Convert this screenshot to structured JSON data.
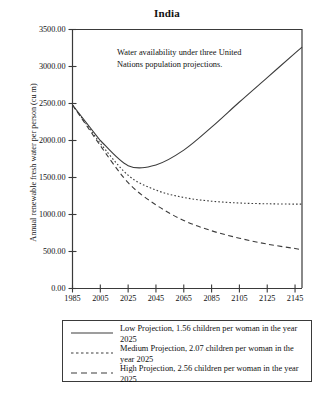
{
  "chart_data": {
    "type": "line",
    "title": "India",
    "xlabel": "",
    "ylabel": "Annual renewable fresh water per person (cu m)",
    "xlim": [
      1985,
      2150
    ],
    "ylim": [
      0,
      3500
    ],
    "grid": false,
    "legend_position": "below",
    "annotation": "Water availability under three United Nations population projections.",
    "xticks": [
      "1985",
      "2005",
      "2025",
      "2045",
      "2065",
      "2085",
      "2105",
      "2125",
      "2145"
    ],
    "xtick_values": [
      1985,
      2005,
      2025,
      2045,
      2065,
      2085,
      2105,
      2125,
      2145
    ],
    "yticks": [
      "0.00",
      "500.00",
      "1000.00",
      "1500.00",
      "2000.00",
      "2500.00",
      "3000.00",
      "3500.00"
    ],
    "ytick_values": [
      0,
      500,
      1000,
      1500,
      2000,
      2500,
      3000,
      3500
    ],
    "x": [
      1985,
      2005,
      2025,
      2045,
      2065,
      2085,
      2105,
      2125,
      2145,
      2150
    ],
    "series": [
      {
        "name": "Low Projection, 1.56 children per woman in the year 2025",
        "style": "solid",
        "color": "#3c3c3c",
        "values": [
          2480,
          2000,
          1660,
          1670,
          1870,
          2180,
          2520,
          2850,
          3180,
          3260
        ]
      },
      {
        "name": "Medium Projection, 2.07 children per woman in the year 2025",
        "style": "dotted",
        "color": "#3c3c3c",
        "values": [
          2480,
          1960,
          1530,
          1330,
          1230,
          1180,
          1155,
          1145,
          1140,
          1140
        ]
      },
      {
        "name": "High Projection, 2.56 children per woman in the year 2025",
        "style": "dashed",
        "color": "#3c3c3c",
        "values": [
          2480,
          1930,
          1430,
          1130,
          920,
          780,
          680,
          600,
          540,
          525
        ]
      }
    ]
  },
  "legend": {
    "entries": [
      {
        "line1": "Low Projection, 1.56 children per woman in",
        "line2": "the year 2025",
        "style": "solid"
      },
      {
        "line1": "Medium Projection, 2.07 children per woman",
        "line2": "in the year 2025",
        "style": "dotted"
      },
      {
        "line1": "High Projection, 2.56 children per woman",
        "line2": "in the year 2025",
        "style": "dashed"
      }
    ]
  }
}
